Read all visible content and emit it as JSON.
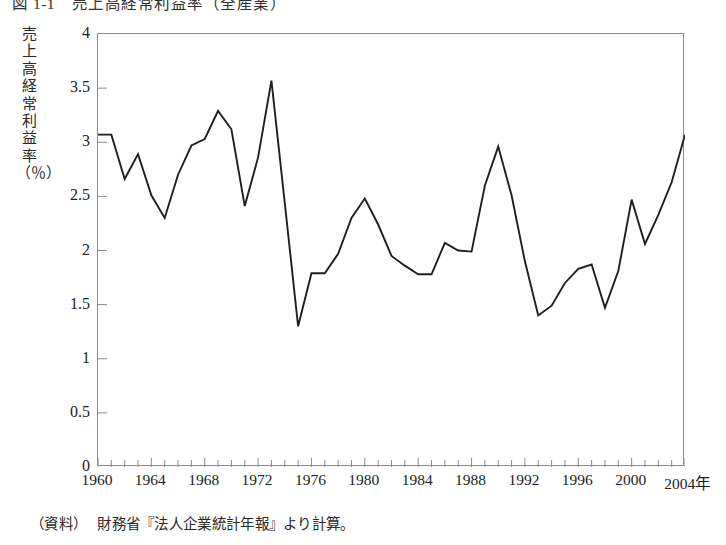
{
  "figure": {
    "title": "図 1-1　売上高経常利益率（全産業）",
    "source_label": "（資料）",
    "source_text": "財務省『法人企業統計年報』より計算。",
    "y_axis_caption": "売上高経常利益率（％）",
    "x_axis_unit_suffix": "年",
    "line_color": "#211f1d",
    "frame_color": "#8b8b87",
    "background_color": "#ffffff"
  },
  "chart_data": {
    "type": "line",
    "title": "売上高経常利益率（全産業）",
    "xlabel": "年",
    "ylabel": "売上高経常利益率（％）",
    "xlim": [
      1960,
      2004
    ],
    "ylim": [
      0,
      4
    ],
    "ytick_values": [
      0,
      0.5,
      1,
      1.5,
      2,
      2.5,
      3,
      3.5,
      4
    ],
    "ytick_labels": [
      "0",
      "0.5",
      "1",
      "1.5",
      "2",
      "2.5",
      "3",
      "3.5",
      "4"
    ],
    "xtick_values": [
      1960,
      1964,
      1968,
      1972,
      1976,
      1980,
      1984,
      1988,
      1992,
      1996,
      2000,
      2004
    ],
    "xtick_labels": [
      "1960",
      "1964",
      "1968",
      "1972",
      "1976",
      "1980",
      "1984",
      "1988",
      "1992",
      "1996",
      "2000",
      "2004年"
    ],
    "minor_xticks_every": 1,
    "grid": false,
    "legend": false,
    "series": [
      {
        "name": "売上高経常利益率",
        "x": [
          1960,
          1961,
          1962,
          1963,
          1964,
          1965,
          1966,
          1967,
          1968,
          1969,
          1970,
          1971,
          1972,
          1973,
          1974,
          1975,
          1976,
          1977,
          1978,
          1979,
          1980,
          1981,
          1982,
          1983,
          1984,
          1985,
          1986,
          1987,
          1988,
          1989,
          1990,
          1991,
          1992,
          1993,
          1994,
          1995,
          1996,
          1997,
          1998,
          1999,
          2000,
          2001,
          2002,
          2003,
          2004
        ],
        "values": [
          3.07,
          3.07,
          2.66,
          2.89,
          2.51,
          2.3,
          2.7,
          2.97,
          3.03,
          3.29,
          3.12,
          2.41,
          2.86,
          3.57,
          2.44,
          1.3,
          1.79,
          1.79,
          1.97,
          2.3,
          2.48,
          2.24,
          1.95,
          1.86,
          1.78,
          1.78,
          2.07,
          2.0,
          1.99,
          2.6,
          2.96,
          2.51,
          1.9,
          1.4,
          1.49,
          1.7,
          1.83,
          1.87,
          1.47,
          1.81,
          2.47,
          2.06,
          2.33,
          2.63,
          3.07
        ]
      }
    ]
  }
}
